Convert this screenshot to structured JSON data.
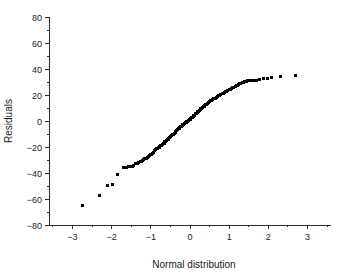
{
  "chart_data": {
    "type": "scatter",
    "title": "",
    "xlabel": "Normal distribution",
    "ylabel": "Residuals",
    "xlim": [
      -3.6,
      3.6
    ],
    "ylim": [
      -80,
      80
    ],
    "xticks": [
      -3,
      -2,
      -1,
      0,
      1,
      2,
      3
    ],
    "xtick_labels": [
      "−3",
      "−2",
      "−1",
      "0",
      "1",
      "2",
      "3"
    ],
    "x_minor_step": 0.5,
    "yticks": [
      -80,
      -60,
      -40,
      -20,
      0,
      20,
      40,
      60,
      80
    ],
    "ytick_labels": [
      "−80",
      "−60",
      "−40",
      "−20",
      "0",
      "20",
      "40",
      "60",
      "80"
    ],
    "y_minor_step": 10,
    "grid": false,
    "legend": null,
    "marker": {
      "shape": "square",
      "size_px": 3,
      "color": "#000000"
    },
    "series": [
      {
        "name": "Residual quantiles",
        "points": [
          [
            -2.75,
            -65.0
          ],
          [
            -2.32,
            -57.0
          ],
          [
            -2.11,
            -49.5
          ],
          [
            -1.98,
            -49.0
          ],
          [
            -1.86,
            -41.0
          ],
          [
            -1.7,
            -35.5
          ],
          [
            -1.63,
            -35.4
          ],
          [
            -1.57,
            -35.2
          ],
          [
            -1.52,
            -35.0
          ],
          [
            -1.47,
            -34.8
          ],
          [
            -1.43,
            -34.0
          ],
          [
            -1.39,
            -33.0
          ],
          [
            -1.35,
            -32.5
          ],
          [
            -1.31,
            -32.0
          ],
          [
            -1.27,
            -31.5
          ],
          [
            -1.24,
            -31.0
          ],
          [
            -1.21,
            -30.0
          ],
          [
            -1.18,
            -29.5
          ],
          [
            -1.15,
            -29.0
          ],
          [
            -1.12,
            -28.5
          ],
          [
            -1.09,
            -28.0
          ],
          [
            -1.06,
            -27.0
          ],
          [
            -1.03,
            -26.5
          ],
          [
            -1.0,
            -26.0
          ],
          [
            -0.98,
            -25.5
          ],
          [
            -0.95,
            -25.0
          ],
          [
            -0.93,
            -24.0
          ],
          [
            -0.9,
            -22.5
          ],
          [
            -0.88,
            -22.0
          ],
          [
            -0.86,
            -21.5
          ],
          [
            -0.83,
            -21.0
          ],
          [
            -0.81,
            -20.5
          ],
          [
            -0.79,
            -20.0
          ],
          [
            -0.77,
            -19.5
          ],
          [
            -0.75,
            -19.0
          ],
          [
            -0.72,
            -18.5
          ],
          [
            -0.7,
            -18.0
          ],
          [
            -0.68,
            -17.5
          ],
          [
            -0.66,
            -17.0
          ],
          [
            -0.64,
            -16.0
          ],
          [
            -0.62,
            -15.5
          ],
          [
            -0.6,
            -15.0
          ],
          [
            -0.58,
            -14.5
          ],
          [
            -0.56,
            -14.0
          ],
          [
            -0.54,
            -13.5
          ],
          [
            -0.52,
            -13.0
          ],
          [
            -0.5,
            -12.0
          ],
          [
            -0.48,
            -11.5
          ],
          [
            -0.46,
            -11.0
          ],
          [
            -0.44,
            -10.5
          ],
          [
            -0.42,
            -10.0
          ],
          [
            -0.4,
            -9.5
          ],
          [
            -0.38,
            -9.0
          ],
          [
            -0.36,
            -8.0
          ],
          [
            -0.34,
            -7.0
          ],
          [
            -0.32,
            -6.5
          ],
          [
            -0.3,
            -6.0
          ],
          [
            -0.28,
            -5.5
          ],
          [
            -0.26,
            -5.0
          ],
          [
            -0.24,
            -4.5
          ],
          [
            -0.22,
            -4.0
          ],
          [
            -0.2,
            -3.5
          ],
          [
            -0.18,
            -3.0
          ],
          [
            -0.16,
            -2.5
          ],
          [
            -0.14,
            -2.0
          ],
          [
            -0.12,
            -1.5
          ],
          [
            -0.1,
            -1.0
          ],
          [
            -0.08,
            -0.5
          ],
          [
            -0.06,
            0.0
          ],
          [
            -0.04,
            0.5
          ],
          [
            -0.02,
            1.0
          ],
          [
            0.0,
            1.5
          ],
          [
            0.02,
            2.0
          ],
          [
            0.04,
            2.5
          ],
          [
            0.06,
            3.0
          ],
          [
            0.08,
            3.5
          ],
          [
            0.1,
            4.0
          ],
          [
            0.12,
            4.5
          ],
          [
            0.14,
            5.5
          ],
          [
            0.16,
            6.0
          ],
          [
            0.18,
            6.5
          ],
          [
            0.2,
            7.0
          ],
          [
            0.22,
            7.5
          ],
          [
            0.24,
            8.0
          ],
          [
            0.26,
            9.0
          ],
          [
            0.28,
            9.5
          ],
          [
            0.3,
            10.0
          ],
          [
            0.32,
            10.5
          ],
          [
            0.34,
            11.0
          ],
          [
            0.36,
            11.5
          ],
          [
            0.38,
            12.0
          ],
          [
            0.4,
            12.5
          ],
          [
            0.42,
            13.0
          ],
          [
            0.44,
            13.5
          ],
          [
            0.46,
            14.0
          ],
          [
            0.48,
            14.5
          ],
          [
            0.5,
            15.0
          ],
          [
            0.53,
            15.5
          ],
          [
            0.56,
            16.0
          ],
          [
            0.58,
            16.5
          ],
          [
            0.61,
            17.0
          ],
          [
            0.64,
            17.5
          ],
          [
            0.67,
            18.0
          ],
          [
            0.7,
            19.0
          ],
          [
            0.73,
            19.5
          ],
          [
            0.76,
            20.0
          ],
          [
            0.79,
            20.5
          ],
          [
            0.82,
            21.0
          ],
          [
            0.85,
            21.5
          ],
          [
            0.88,
            22.0
          ],
          [
            0.91,
            22.5
          ],
          [
            0.94,
            23.0
          ],
          [
            0.97,
            23.5
          ],
          [
            1.0,
            24.0
          ],
          [
            1.03,
            24.5
          ],
          [
            1.06,
            25.0
          ],
          [
            1.09,
            25.5
          ],
          [
            1.12,
            26.0
          ],
          [
            1.15,
            26.5
          ],
          [
            1.18,
            27.0
          ],
          [
            1.21,
            27.5
          ],
          [
            1.24,
            28.0
          ],
          [
            1.27,
            28.5
          ],
          [
            1.3,
            29.0
          ],
          [
            1.33,
            29.5
          ],
          [
            1.36,
            30.0
          ],
          [
            1.39,
            30.2
          ],
          [
            1.42,
            30.4
          ],
          [
            1.45,
            30.6
          ],
          [
            1.48,
            30.8
          ],
          [
            1.52,
            31.0
          ],
          [
            1.58,
            31.0
          ],
          [
            1.64,
            31.2
          ],
          [
            1.7,
            31.5
          ],
          [
            1.78,
            32.0
          ],
          [
            1.88,
            32.5
          ],
          [
            1.97,
            33.0
          ],
          [
            2.08,
            33.2
          ],
          [
            2.3,
            34.5
          ],
          [
            2.7,
            35.0
          ]
        ]
      }
    ]
  },
  "geometry": {
    "plot_left_px": 49,
    "plot_right_px": 331,
    "plot_top_px": 17,
    "plot_bottom_px": 225
  }
}
